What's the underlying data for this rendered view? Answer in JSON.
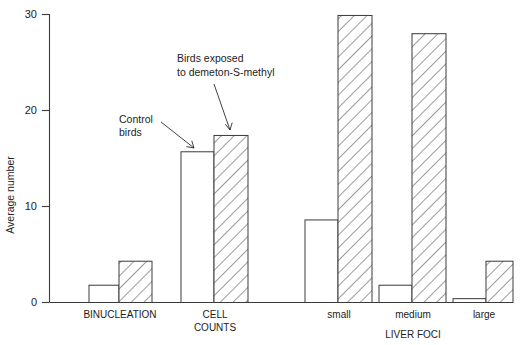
{
  "chart_data": {
    "type": "bar",
    "title": "",
    "xlabel": "",
    "ylabel": "Average number",
    "ylim": [
      0,
      30
    ],
    "yticks": [
      0,
      10,
      20,
      30
    ],
    "ytick_labels": [
      "0",
      "10",
      "20",
      "30"
    ],
    "grid": false,
    "legend_position": "annotations",
    "categories": [
      "BINUCLEATION",
      "CELL COUNTS",
      "small",
      "medium",
      "large"
    ],
    "group_labels": [
      {
        "label": "BINUCLEATION",
        "lines": [
          "BINUCLEATION"
        ]
      },
      {
        "label": "CELL COUNTS",
        "lines": [
          "CELL",
          "COUNTS"
        ]
      },
      {
        "label": "small",
        "lines": [
          "small"
        ]
      },
      {
        "label": "medium",
        "lines": [
          "medium"
        ]
      },
      {
        "label": "large",
        "lines": [
          "large"
        ]
      }
    ],
    "super_group_label": "LIVER FOCI",
    "series": [
      {
        "name": "Control birds",
        "style": "open",
        "values": [
          1.8,
          15.7,
          8.6,
          1.8,
          0.4
        ]
      },
      {
        "name": "Birds exposed to demeton-S-methyl",
        "style": "hatched",
        "values": [
          4.3,
          17.4,
          29.9,
          28.0,
          4.3
        ]
      }
    ],
    "annotations": [
      {
        "id": "control-annotation",
        "lines": [
          "Control",
          "birds"
        ],
        "target_series": "Control birds",
        "target_category": "CELL COUNTS"
      },
      {
        "id": "exposed-annotation",
        "lines": [
          "Birds exposed",
          "to demeton-S-methyl"
        ],
        "target_series": "Birds exposed to demeton-S-methyl",
        "target_category": "CELL COUNTS"
      }
    ],
    "colors": {
      "axis": "#3a3a3a",
      "bar_stroke": "#3a3a3a",
      "bar_fill": "#ffffff",
      "text": "#1a1a1a",
      "background": "#ffffff"
    }
  },
  "axis": {
    "y_title": "Average number",
    "tick_0": "0",
    "tick_10": "10",
    "tick_20": "20",
    "tick_30": "30"
  },
  "labels": {
    "binucleation": "BINUCLEATION",
    "cell": "CELL",
    "counts": "COUNTS",
    "small": "small",
    "medium": "medium",
    "large": "large",
    "liver_foci": "LIVER FOCI"
  },
  "annotations": {
    "control_line1": "Control",
    "control_line2": "birds",
    "exposed_line1": "Birds exposed",
    "exposed_line2": "to demeton-S-methyl"
  }
}
